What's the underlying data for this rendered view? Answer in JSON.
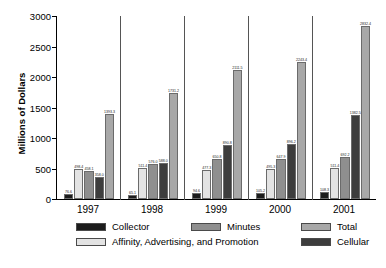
{
  "chart_data": {
    "type": "bar",
    "title": "",
    "subtitle": "",
    "xlabel": "",
    "ylabel": "Millions of Dollars",
    "ylim": [
      0,
      3000
    ],
    "yticks": [
      0,
      500,
      1000,
      1500,
      2000,
      2500,
      3000
    ],
    "ytick_labels": [
      "0",
      "500",
      "1000",
      "1500",
      "2000",
      "2500",
      "3000"
    ],
    "grid": false,
    "legend_position": "below",
    "group_separators": true,
    "categories": [
      "1997",
      "1998",
      "1999",
      "2000",
      "2001"
    ],
    "series": [
      {
        "name": "Collector",
        "color": "#1c1c1c",
        "values": [
          76.6,
          65.1,
          94.6,
          105.2,
          108.3
        ],
        "labels": [
          "76.6",
          "65.1",
          "94.6",
          "105.2",
          "108.3"
        ]
      },
      {
        "name": "Affinity, Advertising, and Promotion",
        "color": "#e3e3e3",
        "values": [
          498.4,
          511.4,
          477.3,
          495.3,
          511.4
        ],
        "labels": [
          "498.4",
          "511.4",
          "477.3",
          "495.3",
          "511.4"
        ]
      },
      {
        "name": "Minutes",
        "color": "#8f8f8f",
        "values": [
          458.1,
          576.0,
          650.8,
          647.9,
          692.2
        ],
        "labels": [
          "458.1",
          "576.0",
          "650.8",
          "647.9",
          "692.2"
        ]
      },
      {
        "name": "Cellular",
        "color": "#3d3d3d",
        "values": [
          358.0,
          588.0,
          890.8,
          896.2,
          1382.5
        ],
        "labels": [
          "358.0",
          "588.0",
          "890.8",
          "896.2",
          "1382.5"
        ]
      },
      {
        "name": "Total",
        "color": "#a8a8a8",
        "values": [
          1393.3,
          1731.2,
          2111.5,
          2243.4,
          2832.4
        ],
        "labels": [
          "1393.3",
          "1731.2",
          "2111.5",
          "2243.4",
          "2832.4"
        ]
      }
    ]
  },
  "legend": {
    "entries": [
      {
        "label": "Collector",
        "color": "#1c1c1c"
      },
      {
        "label": "Minutes",
        "color": "#8f8f8f"
      },
      {
        "label": "Total",
        "color": "#a8a8a8"
      },
      {
        "label": "Affinity, Advertising, and Promotion",
        "color": "#e3e3e3"
      },
      {
        "label": "Cellular",
        "color": "#3d3d3d"
      }
    ]
  }
}
